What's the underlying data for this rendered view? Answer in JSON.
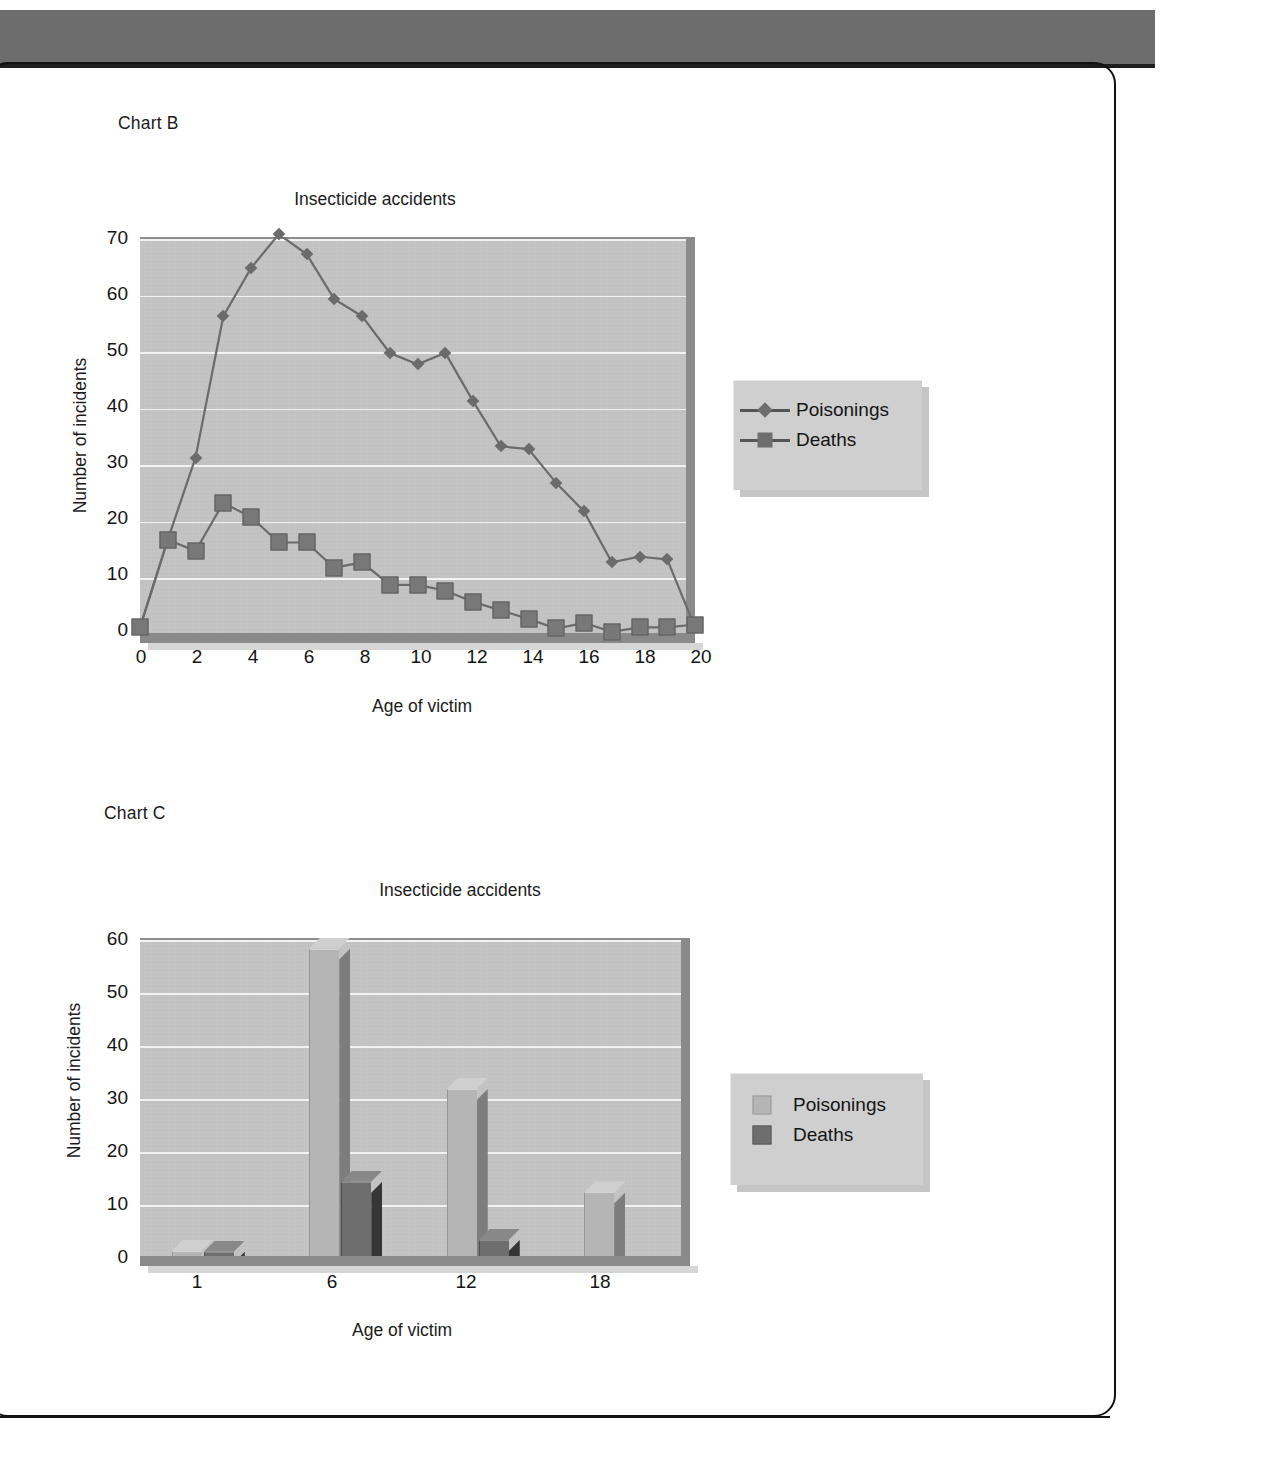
{
  "page": {
    "chart_b_label": "Chart B",
    "chart_c_label": "Chart C"
  },
  "chart_data": [
    {
      "id": "chart-b",
      "type": "line",
      "title": "Insecticide accidents",
      "xlabel": "Age of victim",
      "ylabel": "Number of incidents",
      "xlim": [
        0,
        20
      ],
      "ylim": [
        0,
        70
      ],
      "yticks": [
        70,
        60,
        50,
        40,
        30,
        20,
        10,
        0
      ],
      "xticks": [
        0,
        2,
        4,
        6,
        8,
        10,
        12,
        14,
        16,
        18,
        20
      ],
      "grid": true,
      "legend_position": "right",
      "x": [
        0,
        1,
        2,
        3,
        4,
        5,
        6,
        7,
        8,
        9,
        10,
        11,
        12,
        13,
        14,
        15,
        16,
        17,
        18,
        19,
        20
      ],
      "series": [
        {
          "name": "Poisonings",
          "marker": "diamond",
          "color": "#6b6b6b",
          "values": [
            1,
            16.5,
            31,
            56,
            64.5,
            70.5,
            67,
            59,
            56,
            49.5,
            47.5,
            49.5,
            41,
            33,
            32.5,
            26.5,
            21.5,
            12.5,
            13.5,
            13,
            1
          ]
        },
        {
          "name": "Deaths",
          "marker": "square",
          "color": "#787878",
          "values": [
            1,
            16.5,
            14.5,
            23,
            20.5,
            16,
            16,
            11.5,
            12.5,
            8.5,
            8.5,
            7.5,
            5.5,
            4,
            2.5,
            0.8,
            1.8,
            0.2,
            1,
            1,
            1.5
          ]
        }
      ]
    },
    {
      "id": "chart-c",
      "type": "bar",
      "title": "Insecticide accidents",
      "xlabel": "Age of victim",
      "ylabel": "Number of incidents",
      "ylim": [
        0,
        60
      ],
      "yticks": [
        60,
        50,
        40,
        30,
        20,
        10,
        0
      ],
      "categories": [
        "1",
        "6",
        "12",
        "18"
      ],
      "grid": true,
      "legend_position": "right",
      "series": [
        {
          "name": "Poisonings",
          "color": "#b5b5b5",
          "values": [
            1,
            58,
            31.5,
            12
          ]
        },
        {
          "name": "Deaths",
          "color": "#6e6e6e",
          "values": [
            0.8,
            14,
            3,
            0
          ]
        }
      ]
    }
  ],
  "colors": {
    "plot_background": "#c3c3c3",
    "gridline": "#f2f2f2",
    "axis_wall": "#8a8a8a",
    "legend_background": "#cfcfcf",
    "top_bar": "#6d6d6d",
    "frame": "#111111",
    "poisonings_line": "#6b6b6b",
    "deaths_line": "#787878",
    "poisonings_bar": "#b5b5b5",
    "deaths_bar": "#6e6e6e"
  }
}
